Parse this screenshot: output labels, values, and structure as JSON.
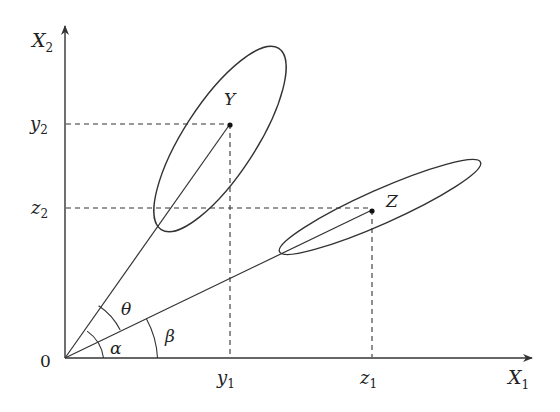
{
  "diagram": {
    "type": "vector-projection-diagram",
    "axes": {
      "x_label": "X",
      "x_sub": "1",
      "y_label": "X",
      "y_sub": "2",
      "origin_label": "0"
    },
    "points": {
      "Y": {
        "label": "Y",
        "x_tick": "y",
        "x_tick_sub": "1",
        "y_tick": "y",
        "y_tick_sub": "2"
      },
      "Z": {
        "label": "Z",
        "x_tick": "z",
        "x_tick_sub": "1",
        "y_tick": "z",
        "y_tick_sub": "2"
      }
    },
    "angles": {
      "theta": "θ",
      "alpha": "α",
      "beta": "β"
    },
    "colors": {
      "stroke": "#333333",
      "background": "#ffffff"
    }
  }
}
